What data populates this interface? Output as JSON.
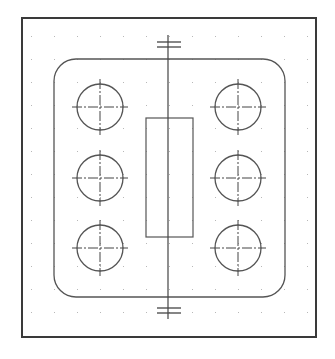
{
  "drawing": {
    "type": "cad-plate-layout",
    "colors": {
      "background": "#ffffff",
      "frame": "#3a3a3a",
      "outline": "#555555",
      "grid_dot": "#b8b8b8",
      "centerline": "#444444"
    },
    "frame": {
      "x": 22,
      "y": 18,
      "w": 294,
      "h": 319
    },
    "grid": {
      "x0": 31,
      "y0": 36,
      "spacing": 23,
      "cols": 13,
      "rows": 13
    },
    "plate": {
      "x": 54,
      "y": 59,
      "w": 231,
      "h": 238,
      "radius": 22
    },
    "slot": {
      "x": 146,
      "y": 118,
      "w": 47,
      "h": 119
    },
    "centerline": {
      "x": 168,
      "y1": 35,
      "y2": 319
    },
    "break_ticks": [
      {
        "y": 42,
        "x1": 157,
        "x2": 181
      },
      {
        "y": 47,
        "x1": 157,
        "x2": 181
      },
      {
        "y": 308,
        "x1": 157,
        "x2": 181
      },
      {
        "y": 313,
        "x1": 157,
        "x2": 181
      }
    ],
    "holes": [
      {
        "cx": 100,
        "cy": 107,
        "r": 23
      },
      {
        "cx": 100,
        "cy": 178,
        "r": 23
      },
      {
        "cx": 100,
        "cy": 248,
        "r": 23
      },
      {
        "cx": 238,
        "cy": 107,
        "r": 23
      },
      {
        "cx": 238,
        "cy": 178,
        "r": 23
      },
      {
        "cx": 238,
        "cy": 248,
        "r": 23
      }
    ]
  }
}
